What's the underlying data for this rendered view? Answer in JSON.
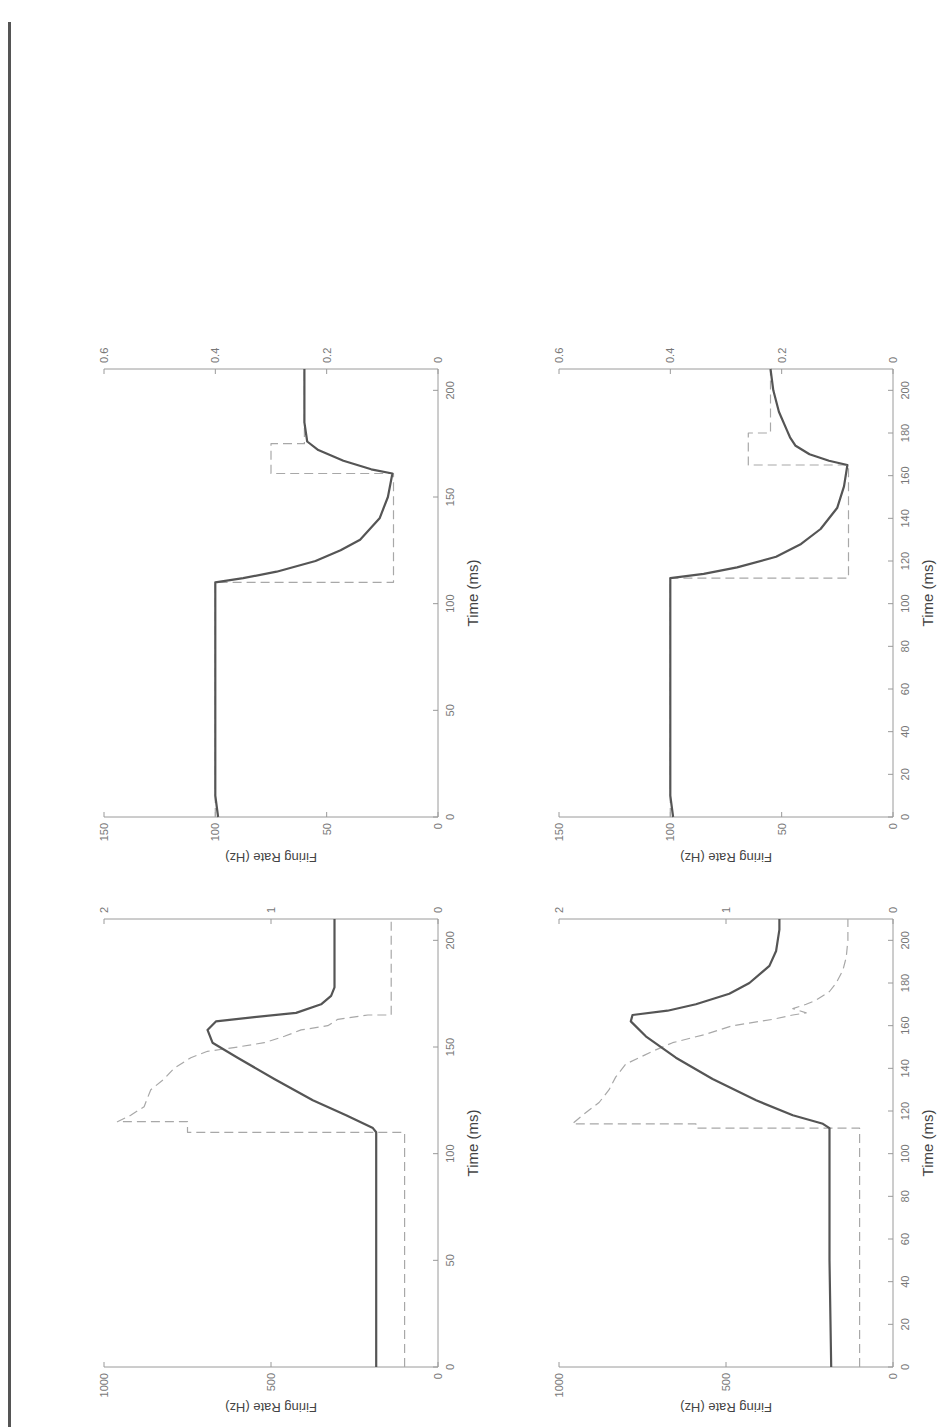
{
  "page": {
    "header_text": "...",
    "orientation": "page scanned rotated 180°, figures printed sideways (landscape)"
  },
  "chart_data": [
    {
      "id": "panel-a",
      "position": "top-left (of unrotated page: lower-right in screenshot)",
      "type": "line",
      "title": "",
      "xlabel": "Time (ms)",
      "ylabel": "Firing Rate (Hz)",
      "y2label": "Active-state Tension (N)",
      "xlim": [
        0,
        210
      ],
      "ylim": [
        0,
        150
      ],
      "y2lim": [
        0,
        0.6
      ],
      "xticks": [
        0,
        50,
        100,
        150,
        200
      ],
      "yticks": [
        0,
        50,
        100,
        150
      ],
      "y2ticks": [
        0,
        0.2,
        0.4,
        0.6
      ],
      "grid": false,
      "series": [
        {
          "name": "Firing rate",
          "style": "dashed",
          "axis": "left",
          "x": [
            0,
            110,
            110,
            161,
            161,
            175,
            175,
            210
          ],
          "y": [
            100,
            100,
            20,
            20,
            75,
            75,
            60,
            60
          ]
        },
        {
          "name": "Active-state tension",
          "style": "solid",
          "axis": "right",
          "x": [
            0,
            10,
            30,
            110,
            112,
            115,
            120,
            125,
            130,
            140,
            150,
            161,
            163,
            167,
            172,
            176,
            185,
            195,
            210
          ],
          "y": [
            0.395,
            0.4,
            0.4,
            0.4,
            0.35,
            0.29,
            0.22,
            0.175,
            0.14,
            0.105,
            0.09,
            0.082,
            0.12,
            0.17,
            0.215,
            0.235,
            0.24,
            0.24,
            0.24
          ]
        }
      ]
    },
    {
      "id": "panel-b",
      "position": "top-right (of unrotated page: lower-left in screenshot)",
      "type": "line",
      "title": "",
      "xlabel": "Time (ms)",
      "ylabel": "Firing Rate (Hz)",
      "y2label": "Active-state Tension (N)",
      "xlim": [
        0,
        210
      ],
      "ylim": [
        0,
        150
      ],
      "y2lim": [
        0,
        0.6
      ],
      "xticks": [
        0,
        20,
        40,
        60,
        80,
        100,
        120,
        140,
        160,
        180,
        200
      ],
      "yticks": [
        0,
        50,
        100,
        150
      ],
      "y2ticks": [
        0,
        0.2,
        0.4,
        0.6
      ],
      "grid": false,
      "series": [
        {
          "name": "Firing rate",
          "style": "dashed",
          "axis": "left",
          "x": [
            0,
            112,
            112,
            165,
            165,
            180,
            180,
            210
          ],
          "y": [
            100,
            100,
            20,
            20,
            65,
            65,
            55,
            55
          ]
        },
        {
          "name": "Active-state tension",
          "style": "solid",
          "axis": "right",
          "x": [
            0,
            10,
            30,
            112,
            114,
            117,
            122,
            128,
            135,
            145,
            155,
            165,
            167,
            170,
            174,
            178,
            181,
            190,
            200,
            210
          ],
          "y": [
            0.395,
            0.4,
            0.4,
            0.4,
            0.34,
            0.28,
            0.21,
            0.165,
            0.13,
            0.1,
            0.088,
            0.082,
            0.115,
            0.15,
            0.175,
            0.185,
            0.19,
            0.205,
            0.215,
            0.22
          ]
        }
      ]
    },
    {
      "id": "panel-c",
      "position": "bottom-left (of unrotated page: upper-right in screenshot)",
      "type": "line",
      "title": "",
      "xlabel": "Time (ms)",
      "ylabel": "Firing Rate (Hz)",
      "y2label": "Active-state Tension (N)",
      "xlim": [
        0,
        210
      ],
      "ylim": [
        0,
        1000
      ],
      "y2lim": [
        0,
        2
      ],
      "xticks": [
        0,
        50,
        100,
        150,
        200
      ],
      "yticks": [
        0,
        500,
        1000
      ],
      "y2ticks": [
        0,
        1,
        2
      ],
      "grid": false,
      "series": [
        {
          "name": "Firing rate",
          "style": "dashed",
          "axis": "left",
          "x": [
            0,
            110,
            110,
            115,
            115,
            118,
            122,
            126,
            130,
            135,
            140,
            145,
            148,
            150,
            152,
            155,
            158,
            160,
            163,
            165,
            165,
            200,
            210
          ],
          "y": [
            100,
            100,
            750,
            750,
            960,
            920,
            880,
            870,
            860,
            820,
            790,
            740,
            690,
            600,
            520,
            460,
            410,
            330,
            300,
            210,
            140,
            140,
            140
          ]
        },
        {
          "name": "Active-state tension",
          "style": "solid",
          "axis": "right",
          "x": [
            0,
            50,
            110,
            112,
            118,
            125,
            135,
            145,
            152,
            158,
            162,
            164,
            166,
            170,
            174,
            178,
            185,
            195,
            210
          ],
          "y": [
            0.37,
            0.37,
            0.37,
            0.39,
            0.55,
            0.75,
            0.98,
            1.2,
            1.35,
            1.38,
            1.33,
            1.1,
            0.85,
            0.7,
            0.64,
            0.62,
            0.62,
            0.62,
            0.62
          ]
        }
      ]
    },
    {
      "id": "panel-d",
      "position": "bottom-right (of unrotated page: upper-left in screenshot)",
      "type": "line",
      "title": "",
      "xlabel": "Time (ms)",
      "ylabel": "Firing Rate (Hz)",
      "y2label": "Active-state Tension (N)",
      "xlim": [
        0,
        210
      ],
      "ylim": [
        0,
        1000
      ],
      "y2lim": [
        0,
        2
      ],
      "xticks": [
        0,
        20,
        40,
        60,
        80,
        100,
        120,
        140,
        160,
        180,
        200
      ],
      "yticks": [
        0,
        500,
        1000
      ],
      "y2ticks": [
        0,
        1,
        2
      ],
      "grid": false,
      "series": [
        {
          "name": "Firing rate",
          "style": "dashed",
          "axis": "left",
          "x": [
            0,
            112,
            112,
            114,
            114,
            118,
            124,
            130,
            136,
            142,
            148,
            152,
            156,
            160,
            163,
            165,
            166,
            168,
            170,
            172,
            176,
            180,
            186,
            192,
            200,
            210
          ],
          "y": [
            100,
            100,
            590,
            590,
            960,
            930,
            880,
            850,
            830,
            800,
            720,
            660,
            560,
            480,
            360,
            300,
            260,
            300,
            260,
            230,
            190,
            170,
            150,
            140,
            135,
            135
          ]
        },
        {
          "name": "Active-state tension",
          "style": "solid",
          "axis": "right",
          "x": [
            0,
            50,
            112,
            114,
            118,
            125,
            135,
            145,
            155,
            162,
            165,
            167,
            170,
            175,
            180,
            188,
            195,
            205,
            210
          ],
          "y": [
            0.37,
            0.38,
            0.38,
            0.42,
            0.6,
            0.82,
            1.08,
            1.3,
            1.48,
            1.57,
            1.56,
            1.35,
            1.18,
            0.98,
            0.86,
            0.74,
            0.7,
            0.68,
            0.68
          ]
        }
      ]
    }
  ]
}
